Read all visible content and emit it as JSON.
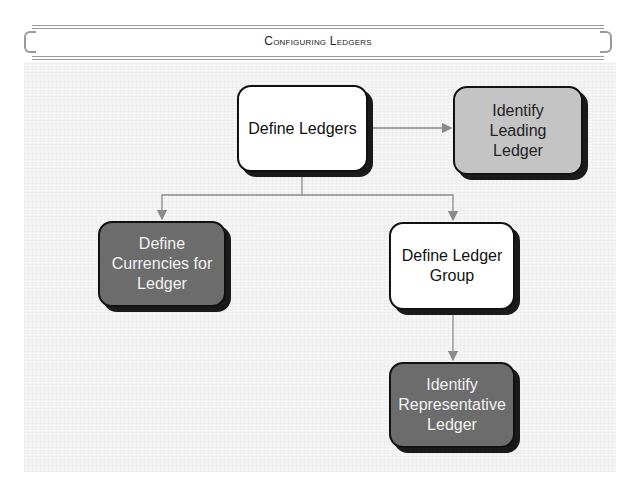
{
  "header": {
    "title": "Configuring Ledgers"
  },
  "diagram": {
    "nodes": [
      {
        "id": "define-ledgers",
        "label": "Define Ledgers",
        "style": "white"
      },
      {
        "id": "identify-leading-ledger",
        "label": "Identify\nLeading\nLedger",
        "style": "light"
      },
      {
        "id": "define-currencies",
        "label": "Define\nCurrencies for\nLedger",
        "style": "dark"
      },
      {
        "id": "define-ledger-group",
        "label": "Define Ledger\nGroup",
        "style": "white"
      },
      {
        "id": "identify-representative-ledger",
        "label": "Identify\nRepresentative\nLedger",
        "style": "dark"
      }
    ],
    "edges": [
      {
        "from": "define-ledgers",
        "to": "identify-leading-ledger"
      },
      {
        "from": "define-ledgers",
        "to": "define-currencies"
      },
      {
        "from": "define-ledgers",
        "to": "define-ledger-group"
      },
      {
        "from": "define-ledger-group",
        "to": "identify-representative-ledger"
      }
    ],
    "colors": {
      "white": "#ffffff",
      "light": "#c4c4c4",
      "dark": "#6c6c6c",
      "connector": "#8a8a8a",
      "border": "#111111"
    }
  }
}
